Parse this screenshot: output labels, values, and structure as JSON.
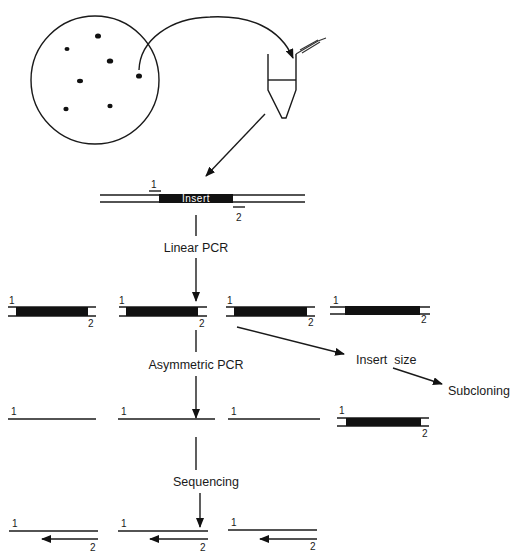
{
  "diagram": {
    "type": "flowchart",
    "page_number": "300",
    "source": {
      "plate": "petri-dish-with-colonies",
      "colony_count": 7,
      "tube": "microcentrifuge-tube"
    },
    "template": {
      "insert_label": "Insert",
      "primer_1": "1",
      "primer_2": "2"
    },
    "steps": {
      "linear_pcr": "Linear PCR",
      "asymmetric_pcr": "Asymmetric PCR",
      "sequencing": "Sequencing",
      "insert_size": "Insert  size",
      "subcloning": "Subcloning"
    },
    "labels": {
      "p1": "1",
      "p2": "2"
    }
  }
}
